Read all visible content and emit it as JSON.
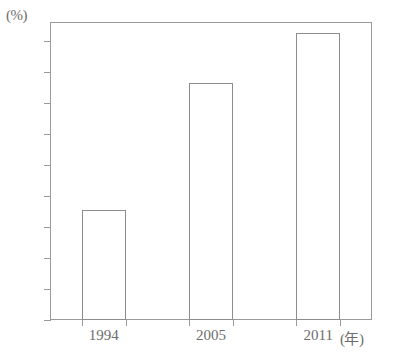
{
  "chart_data": {
    "type": "bar",
    "title": "",
    "subtitle": "",
    "xlabel": "(年)",
    "ylabel": "(%)",
    "categories": [
      "1994",
      "2005",
      "2011"
    ],
    "values": [
      17.7,
      38.2,
      46.2
    ],
    "series": [
      {
        "name": "",
        "values": [
          17.7,
          38.2,
          46.2
        ]
      }
    ],
    "ylim": [
      0,
      48
    ],
    "y_ticks": [
      0,
      5,
      10,
      15,
      20,
      25,
      30,
      35,
      40,
      45
    ],
    "y_tick_labels": [
      "0",
      "5",
      "10",
      "15",
      "20",
      "25",
      "30",
      "35",
      "40",
      "45"
    ],
    "grid": false,
    "legend": false,
    "legend_position": "none",
    "annotations": []
  },
  "axes": {
    "y_unit_label": "(%)",
    "x_unit_label": "(年)",
    "y_tick_labels": [
      "45",
      "40",
      "35",
      "30",
      "25",
      "20",
      "15",
      "10",
      "5",
      "0"
    ],
    "x_tick_labels": [
      "1994",
      "2005",
      "2011"
    ]
  },
  "colors": {
    "background": "#ffffff",
    "frame_line": "#9a9a9a",
    "bar_outline": "#8c8c8c",
    "bar_fill": "#ffffff",
    "text": "#6d6d6d"
  }
}
